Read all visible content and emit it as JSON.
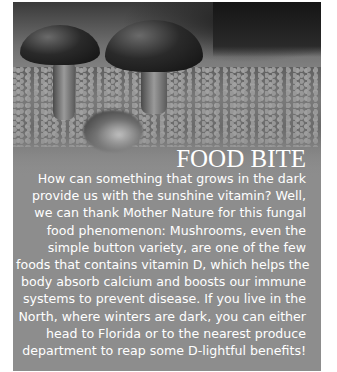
{
  "article": {
    "image": {
      "description": "Black and white photo of mushrooms growing on moss",
      "icon": "mushroom-photo"
    },
    "title": "FOOD BITE",
    "body_lines": [
      "How can something that grows in the dark",
      "provide us with the sunshine vitamin? Well,",
      "we can thank Mother Nature for this fungal",
      "food phenomenon: Mushrooms, even the",
      "simple button variety, are one of the few",
      "foods that contains vitamin D, which helps the",
      "body absorb calcium and boosts our immune",
      "systems to prevent disease. If you live in the",
      "North, where winters are dark, you can either",
      "head to Florida or to the nearest produce",
      "department to reap some D-lightful benefits!"
    ]
  },
  "colors": {
    "panel_gray": "#8d8d8d",
    "text": "#ffffff"
  }
}
